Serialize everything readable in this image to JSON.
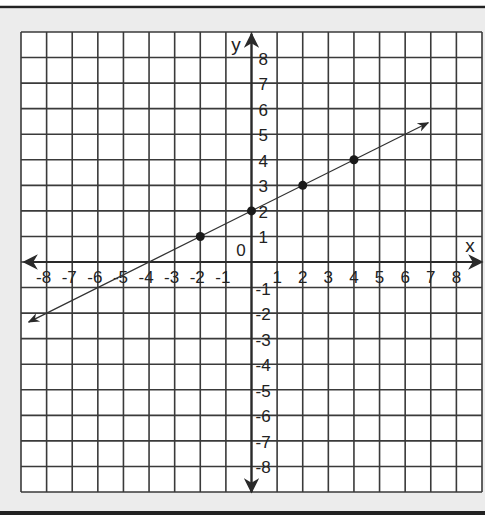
{
  "chart_data": {
    "type": "line",
    "title": "",
    "xlabel": "x",
    "ylabel": "y",
    "xlim": [
      -9,
      9
    ],
    "ylim": [
      -9,
      9
    ],
    "grid": true,
    "origin_label": "0",
    "x_ticks": [
      -8,
      -7,
      -6,
      -5,
      -4,
      -3,
      -2,
      -1,
      1,
      2,
      3,
      4,
      5,
      6,
      7,
      8
    ],
    "y_ticks": [
      -8,
      -7,
      -6,
      -5,
      -4,
      -3,
      -2,
      -1,
      1,
      2,
      3,
      4,
      5,
      6,
      7,
      8
    ],
    "series": [
      {
        "name": "line",
        "equation": "y = 0.5x + 2",
        "slope": 0.5,
        "intercept": 2,
        "arrow_both_ends": true,
        "line_start": [
          -8.7,
          -2.35
        ],
        "line_end": [
          6.9,
          5.45
        ],
        "points": [
          {
            "x": -2,
            "y": 1
          },
          {
            "x": 0,
            "y": 2
          },
          {
            "x": 2,
            "y": 3
          },
          {
            "x": 4,
            "y": 4
          }
        ]
      }
    ]
  },
  "colors": {
    "grid": "#3a3a3a",
    "axis": "#2a2a2a",
    "border_band": "#ececec",
    "outer_rule": "#222222",
    "points": "#1a1a1a"
  }
}
